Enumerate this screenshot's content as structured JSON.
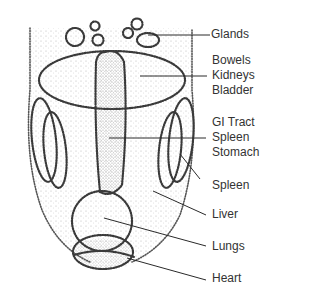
{
  "diagram": {
    "title": "",
    "style": "stippled pen-and-ink face map",
    "colors": {
      "background": "#ffffff",
      "ink": "#333333",
      "leader_line": "#2a2a2a"
    },
    "labels": [
      {
        "id": "glands",
        "lines": [
          "Glands"
        ]
      },
      {
        "id": "bowels_group",
        "lines": [
          "Bowels",
          "Kidneys",
          "Bladder"
        ]
      },
      {
        "id": "gi_group",
        "lines": [
          "GI Tract",
          "Spleen",
          "Stomach"
        ]
      },
      {
        "id": "spleen",
        "lines": [
          "Spleen"
        ]
      },
      {
        "id": "liver",
        "lines": [
          "Liver"
        ]
      },
      {
        "id": "lungs",
        "lines": [
          "Lungs"
        ]
      },
      {
        "id": "heart",
        "lines": [
          "Heart"
        ]
      }
    ]
  }
}
